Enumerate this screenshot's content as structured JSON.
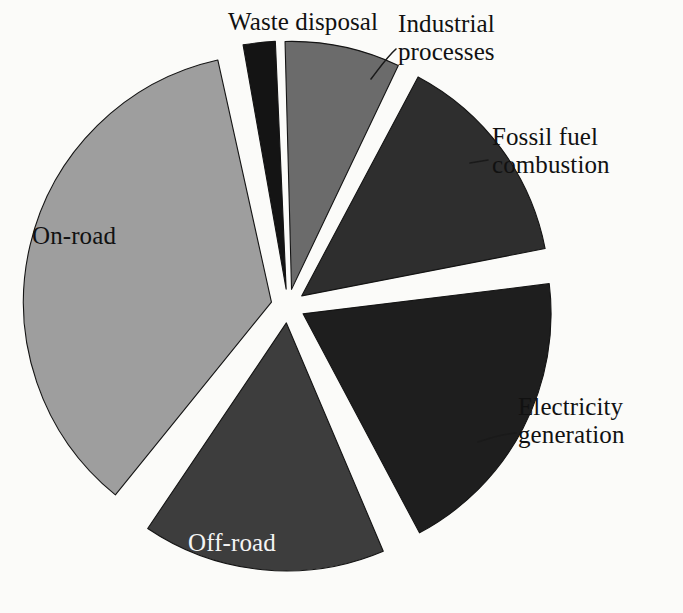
{
  "figure": {
    "background_color": "#fbfbf9",
    "width": 683,
    "height": 613
  },
  "chart_geometry": {
    "center_x": 288,
    "center_y": 306,
    "radius": 248,
    "explode_offset": 17
  },
  "chart_data": {
    "type": "pie",
    "title": "",
    "subtitle": "",
    "xlabel": "",
    "ylabel": "",
    "grid": false,
    "legend_position": "none",
    "label_style": "callout-and-inside",
    "categories": [
      "Waste disposal",
      "Industrial processes",
      "Fossil fuel combustion",
      "Electricity generation",
      "Off-road",
      "On-road"
    ],
    "values": [
      2.0,
      7.5,
      14.5,
      20.0,
      16.0,
      40.0
    ],
    "units": "percent",
    "slices": [
      {
        "label": "Waste disposal",
        "value": 2.0,
        "color": "#141414",
        "start_angle": 350.0,
        "end_angle": 357.5,
        "label_placement": "outside-top",
        "label_x": 228,
        "label_y": 8,
        "label_align": "center",
        "label_lines": [
          "Waste disposal"
        ],
        "leader": false
      },
      {
        "label": "Industrial processes",
        "value": 7.5,
        "color": "#6b6b6b",
        "start_angle": 358.5,
        "end_angle": 25.5,
        "label_placement": "outside-top-right",
        "label_x": 398,
        "label_y": 10,
        "label_align": "left",
        "label_lines": [
          "Industrial",
          "processes"
        ],
        "leader": true,
        "leader_path": "M 371 79 C 381 66, 387 57, 396 49"
      },
      {
        "label": "Fossil fuel combustion",
        "value": 14.5,
        "color": "#2e2e2e",
        "start_angle": 28.0,
        "end_angle": 79.0,
        "label_placement": "outside-right",
        "label_x": 492,
        "label_y": 123,
        "label_align": "left",
        "label_lines": [
          "Fossil fuel",
          "combustion"
        ],
        "leader": true,
        "leader_path": "M 470 163 L 488 160"
      },
      {
        "label": "Electricity generation",
        "value": 20.0,
        "color": "#1e1e1e",
        "start_angle": 83.0,
        "end_angle": 152.0,
        "label_placement": "outside-right-lower",
        "label_x": 518,
        "label_y": 393,
        "label_align": "left",
        "label_lines": [
          "Electricity",
          "generation"
        ],
        "leader": true,
        "leader_path": "M 478 442 C 492 437, 505 434, 516 433"
      },
      {
        "label": "Off-road",
        "value": 16.0,
        "color": "#3d3d3d",
        "start_angle": 157.0,
        "end_angle": 214.0,
        "label_placement": "inside",
        "label_x": 188,
        "label_y": 529,
        "label_align": "left",
        "label_lines": [
          "Off-road"
        ],
        "leader": false
      },
      {
        "label": "On-road",
        "value": 40.0,
        "color": "#9e9e9e",
        "start_angle": 219.0,
        "end_angle": 347.5,
        "label_placement": "inside",
        "label_x": 32,
        "label_y": 222,
        "label_align": "left",
        "label_lines": [
          "On-road"
        ],
        "leader": false
      }
    ]
  }
}
